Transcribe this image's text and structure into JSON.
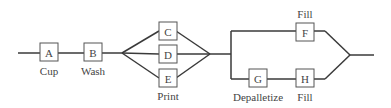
{
  "diagram": {
    "type": "process-flow",
    "nodes": [
      {
        "id": "A",
        "label": "A",
        "caption": "Cup"
      },
      {
        "id": "B",
        "label": "B",
        "caption": "Wash"
      },
      {
        "id": "C",
        "label": "C",
        "caption": ""
      },
      {
        "id": "D",
        "label": "D",
        "caption": ""
      },
      {
        "id": "E",
        "label": "E",
        "caption": "Print"
      },
      {
        "id": "F",
        "label": "F",
        "caption": "Fill"
      },
      {
        "id": "G",
        "label": "G",
        "caption": "Depalletize"
      },
      {
        "id": "H",
        "label": "H",
        "caption": "Fill"
      }
    ],
    "edges": [
      [
        "A",
        "B"
      ],
      [
        "B",
        "C"
      ],
      [
        "B",
        "D"
      ],
      [
        "B",
        "E"
      ],
      [
        "C",
        "F"
      ],
      [
        "D",
        "F"
      ],
      [
        "E",
        "F"
      ],
      [
        "C",
        "G"
      ],
      [
        "D",
        "G"
      ],
      [
        "E",
        "G"
      ],
      [
        "G",
        "H"
      ]
    ]
  }
}
